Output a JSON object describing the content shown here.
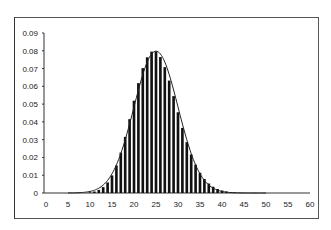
{
  "chart_data": {
    "type": "bar",
    "title": "",
    "xlabel": "",
    "ylabel": "",
    "xlim": [
      0,
      60
    ],
    "ylim": [
      0,
      0.09
    ],
    "x_ticks": [
      "0",
      "5",
      "10",
      "15",
      "20",
      "25",
      "30",
      "35",
      "40",
      "45",
      "50",
      "55",
      "60"
    ],
    "y_ticks": [
      "0",
      "0.01",
      "0.02",
      "0.03",
      "0.04",
      "0.05",
      "0.06",
      "0.07",
      "0.08",
      "0.09"
    ],
    "grid": false,
    "legend": "none",
    "series": [
      {
        "name": "bars",
        "type": "bar",
        "distribution": "approx. Poisson, mean 25",
        "peak_x": 25,
        "peak_y": 0.08
      },
      {
        "name": "fitted curve",
        "type": "line",
        "peak_x": 25,
        "peak_y": 0.08
      }
    ],
    "colors": {
      "bars": "#111111",
      "curve": "#222222",
      "frame": "#555555"
    }
  }
}
